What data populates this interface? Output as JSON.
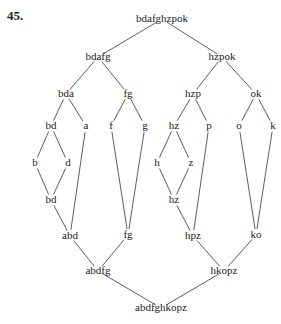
{
  "problem_number": "45.",
  "nodes": {
    "n_top": {
      "label": "bdafghzpok",
      "x": 162,
      "y": 19
    },
    "n_bdafg": {
      "label": "bdafg",
      "x": 98,
      "y": 57
    },
    "n_hzpok": {
      "label": "hzpok",
      "x": 222,
      "y": 57
    },
    "n_bda": {
      "label": "bda",
      "x": 66,
      "y": 94
    },
    "n_fg1": {
      "label": "fg",
      "x": 128,
      "y": 94
    },
    "n_hzp": {
      "label": "hzp",
      "x": 193,
      "y": 94
    },
    "n_ok": {
      "label": "ok",
      "x": 256,
      "y": 94
    },
    "n_bd1": {
      "label": "bd",
      "x": 51,
      "y": 126
    },
    "n_a": {
      "label": "a",
      "x": 86,
      "y": 126
    },
    "n_f": {
      "label": "f",
      "x": 111,
      "y": 126
    },
    "n_g": {
      "label": "g",
      "x": 145,
      "y": 126
    },
    "n_hz1": {
      "label": "hz",
      "x": 174,
      "y": 126
    },
    "n_p": {
      "label": "p",
      "x": 209,
      "y": 126
    },
    "n_o": {
      "label": "o",
      "x": 239,
      "y": 126
    },
    "n_k": {
      "label": "k",
      "x": 273,
      "y": 126
    },
    "n_b": {
      "label": "b",
      "x": 35,
      "y": 163
    },
    "n_d": {
      "label": "d",
      "x": 68,
      "y": 163
    },
    "n_h": {
      "label": "h",
      "x": 157,
      "y": 163
    },
    "n_z": {
      "label": "z",
      "x": 191,
      "y": 163
    },
    "n_bd2": {
      "label": "bd",
      "x": 51,
      "y": 200
    },
    "n_hz2": {
      "label": "hz",
      "x": 174,
      "y": 200
    },
    "n_abd": {
      "label": "abd",
      "x": 70,
      "y": 236
    },
    "n_fg2": {
      "label": "fg",
      "x": 128,
      "y": 235
    },
    "n_hpz": {
      "label": "hpz",
      "x": 193,
      "y": 236
    },
    "n_ko": {
      "label": "ko",
      "x": 256,
      "y": 235
    },
    "n_abdfg": {
      "label": "abdfg",
      "x": 98,
      "y": 271
    },
    "n_hkopz": {
      "label": "hkopz",
      "x": 224,
      "y": 271
    },
    "n_bottom": {
      "label": "abdfghkopz",
      "x": 161,
      "y": 308
    }
  },
  "edges": [
    [
      "n_top",
      "n_bdafg"
    ],
    [
      "n_top",
      "n_hzpok"
    ],
    [
      "n_bdafg",
      "n_bda"
    ],
    [
      "n_bdafg",
      "n_fg1"
    ],
    [
      "n_hzpok",
      "n_hzp"
    ],
    [
      "n_hzpok",
      "n_ok"
    ],
    [
      "n_bda",
      "n_bd1"
    ],
    [
      "n_bda",
      "n_a"
    ],
    [
      "n_fg1",
      "n_f"
    ],
    [
      "n_fg1",
      "n_g"
    ],
    [
      "n_hzp",
      "n_hz1"
    ],
    [
      "n_hzp",
      "n_p"
    ],
    [
      "n_ok",
      "n_o"
    ],
    [
      "n_ok",
      "n_k"
    ],
    [
      "n_bd1",
      "n_b"
    ],
    [
      "n_bd1",
      "n_d"
    ],
    [
      "n_b",
      "n_bd2"
    ],
    [
      "n_d",
      "n_bd2"
    ],
    [
      "n_hz1",
      "n_h"
    ],
    [
      "n_hz1",
      "n_z"
    ],
    [
      "n_h",
      "n_hz2"
    ],
    [
      "n_z",
      "n_hz2"
    ],
    [
      "n_bd2",
      "n_abd"
    ],
    [
      "n_a",
      "n_abd"
    ],
    [
      "n_f",
      "n_fg2"
    ],
    [
      "n_g",
      "n_fg2"
    ],
    [
      "n_hz2",
      "n_hpz"
    ],
    [
      "n_p",
      "n_hpz"
    ],
    [
      "n_o",
      "n_ko"
    ],
    [
      "n_k",
      "n_ko"
    ],
    [
      "n_abd",
      "n_abdfg"
    ],
    [
      "n_fg2",
      "n_abdfg"
    ],
    [
      "n_hpz",
      "n_hkopz"
    ],
    [
      "n_ko",
      "n_hkopz"
    ],
    [
      "n_abdfg",
      "n_bottom"
    ],
    [
      "n_hkopz",
      "n_bottom"
    ]
  ]
}
